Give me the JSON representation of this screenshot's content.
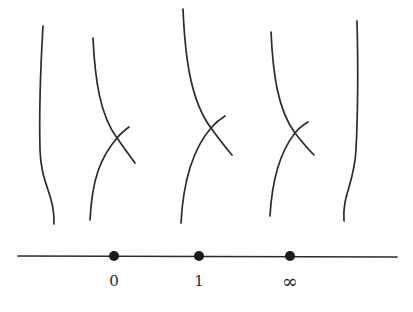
{
  "diagram": {
    "colors": {
      "stroke": "#2b2b2b",
      "background": "#ffffff"
    },
    "base_line": {
      "points": [
        {
          "label": "0",
          "x": 114
        },
        {
          "label": "1",
          "x": 199
        },
        {
          "label": "∞",
          "x": 290
        }
      ]
    },
    "fibers": [
      {
        "name": "smooth-fiber-left",
        "type": "smooth"
      },
      {
        "name": "nodal-fiber-0",
        "type": "node",
        "over_point": "0"
      },
      {
        "name": "nodal-fiber-1",
        "type": "node",
        "over_point": "1"
      },
      {
        "name": "nodal-fiber-infinity",
        "type": "node",
        "over_point": "∞"
      },
      {
        "name": "smooth-fiber-right",
        "type": "smooth"
      }
    ]
  }
}
